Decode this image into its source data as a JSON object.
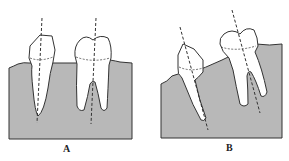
{
  "figure": {
    "panels": [
      {
        "id": "A",
        "label": "A",
        "description": "Upright premolar and molar in bone with vertical long axes"
      },
      {
        "id": "B",
        "label": "B",
        "description": "Mesially tipped premolar and molar in bone with inclined long axes"
      }
    ],
    "colors": {
      "bone": "#b8b8b8",
      "outline": "#333333",
      "tooth": "#ffffff"
    }
  }
}
